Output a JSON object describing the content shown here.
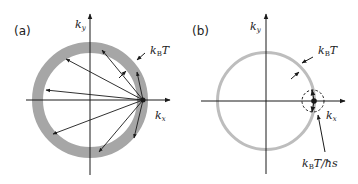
{
  "panels": [
    {
      "id": "a",
      "label": "(a)",
      "ky": "k",
      "ky_sub": "y",
      "kx": "k",
      "kx_sub": "x",
      "ring_label": "k",
      "ring_label_sub": "B",
      "ring_label_tail": "T",
      "ring_color": "#a6a6a6"
    },
    {
      "id": "b",
      "label": "(b)",
      "ky": "k",
      "ky_sub": "y",
      "kx": "k",
      "kx_sub": "x",
      "ring_label": "k",
      "ring_label_sub": "B",
      "ring_label_tail": "T",
      "small_label": "k",
      "small_label_sub": "B",
      "small_label_tail": "T/ħs",
      "ring_color": "#bdbdbd"
    }
  ],
  "colors": {
    "ink": "#1a1a1a",
    "ring_a": "#a6a6a6",
    "ring_b": "#bdbdbd"
  }
}
